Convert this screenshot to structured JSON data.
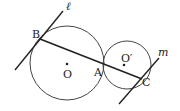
{
  "diagram": {
    "colors": {
      "stroke": "#333333",
      "background": "#ffffff"
    },
    "circles": [
      {
        "id": "O",
        "label": "O",
        "cx": 67,
        "cy": 63,
        "r": 37
      },
      {
        "id": "O2",
        "label": "O′",
        "cx": 127,
        "cy": 65,
        "r": 24
      }
    ],
    "points": {
      "B": {
        "label": "B",
        "x": 40,
        "y": 39
      },
      "A": {
        "label": "A",
        "x": 103,
        "y": 70
      },
      "C": {
        "label": "C",
        "x": 142,
        "y": 79
      }
    },
    "lines": {
      "l": {
        "label": "ℓ"
      },
      "m": {
        "label": "m"
      }
    }
  }
}
